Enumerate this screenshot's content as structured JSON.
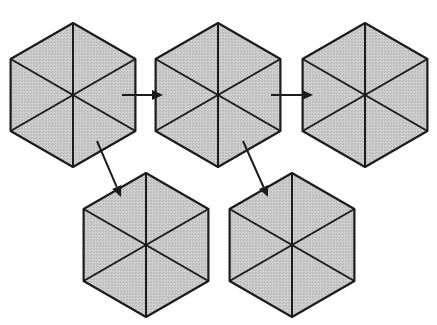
{
  "diagram": {
    "type": "hexagon-subdivision-flow",
    "colors": {
      "fill": "#c6c6c6",
      "stroke": "#1c1c1c",
      "background": "#ffffff"
    },
    "hexagons": [
      {
        "id": "hex-1",
        "cx": 73,
        "cy": 95,
        "r": 72,
        "row": 1,
        "col": 1
      },
      {
        "id": "hex-2",
        "cx": 218,
        "cy": 95,
        "r": 72,
        "row": 1,
        "col": 2
      },
      {
        "id": "hex-3",
        "cx": 365,
        "cy": 95,
        "r": 72,
        "row": 1,
        "col": 3
      },
      {
        "id": "hex-4",
        "cx": 146,
        "cy": 245,
        "r": 72,
        "row": 2,
        "col": 1
      },
      {
        "id": "hex-5",
        "cx": 292,
        "cy": 245,
        "r": 72,
        "row": 2,
        "col": 2
      }
    ],
    "arrows": [
      {
        "id": "arrow-1-2",
        "from": "hex-1",
        "to": "hex-2",
        "x1": 122,
        "y1": 95,
        "x2": 163,
        "y2": 95
      },
      {
        "id": "arrow-2-3",
        "from": "hex-2",
        "to": "hex-3",
        "x1": 271,
        "y1": 95,
        "x2": 313,
        "y2": 95
      },
      {
        "id": "arrow-1-4",
        "from": "hex-1",
        "to": "hex-4",
        "x1": 97,
        "y1": 141,
        "x2": 121,
        "y2": 197
      },
      {
        "id": "arrow-2-5",
        "from": "hex-2",
        "to": "hex-5",
        "x1": 243,
        "y1": 141,
        "x2": 268,
        "y2": 197
      }
    ]
  }
}
